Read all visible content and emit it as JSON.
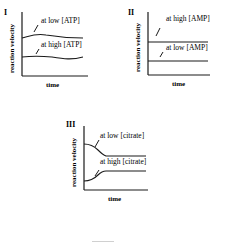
{
  "figure": {
    "panels": [
      {
        "id": "I",
        "ylabel": "reaction velocity",
        "xlabel": "time",
        "curves": [
          {
            "label": "at low [ATP]",
            "shape": "slight rise then slow decline",
            "level": "high"
          },
          {
            "label": "at high [ATP]",
            "shape": "nearly flat, slight dip then rise",
            "level": "low"
          }
        ]
      },
      {
        "id": "II",
        "ylabel": "reaction velocity",
        "xlabel": "time",
        "curves": [
          {
            "label": "at high [AMP]",
            "shape": "flat",
            "level": "high"
          },
          {
            "label": "at low [AMP]",
            "shape": "flat",
            "level": "low"
          }
        ]
      },
      {
        "id": "III",
        "ylabel": "reaction velocity",
        "xlabel": "time",
        "curves": [
          {
            "label": "at low [citrate]",
            "shape": "starts high, decreases, then plateaus",
            "level": "high"
          },
          {
            "label": "at high [citrate]",
            "shape": "starts low, increases, then plateaus",
            "level": "low"
          }
        ]
      }
    ],
    "colors": {
      "ink": "#1a1a1a",
      "background": "#ffffff"
    }
  }
}
